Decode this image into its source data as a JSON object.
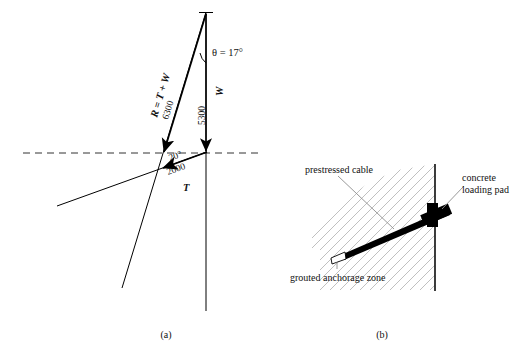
{
  "figure": {
    "panel_a": {
      "caption": "(a)",
      "resultant_label": "R = T + W",
      "resultant_magnitude": "6300",
      "weight_label": "W",
      "weight_magnitude": "5300",
      "tension_label": "T",
      "tension_magnitude": "2000",
      "tension_angle": "20°",
      "theta_label": "θ = 17°"
    },
    "panel_b": {
      "caption": "(b)",
      "label_cable": "prestressed cable",
      "label_pad_line1": "concrete",
      "label_pad_line2": "loading pad",
      "label_anchorage": "grouted anchorage zone"
    },
    "colors": {
      "ink": "#000000",
      "hatch": "#b9b9b9",
      "leader": "#8d8d8d"
    }
  }
}
